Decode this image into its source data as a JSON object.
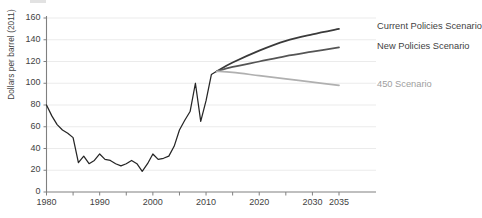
{
  "axes": {
    "ylabel": "Dollars per barrel (2011)",
    "y_ticks": [
      "0",
      "20",
      "40",
      "60",
      "80",
      "100",
      "120",
      "140",
      "160"
    ],
    "x_ticks": [
      "1980",
      "1990",
      "2000",
      "2010",
      "2020",
      "2030",
      "2035"
    ]
  },
  "colors": {
    "historical": "#262626",
    "current_policies": "#3a3a3a",
    "new_policies": "#555555",
    "scenario_450": "#b0b0b0",
    "gridline": "#ebebeb",
    "axis": "#808080",
    "text": "#3f3f3f",
    "muted_text": "#9e9e9e"
  },
  "labels": {
    "current_policies": "Current Policies Scenario",
    "new_policies": "New Policies Scenario",
    "scenario_450": "450 Scenario"
  },
  "chart_data": {
    "type": "line",
    "title": "",
    "xlabel": "",
    "ylabel": "Dollars per barrel (2011)",
    "xlim": [
      1980,
      2035
    ],
    "ylim": [
      0,
      160
    ],
    "ytick_step": 20,
    "xtick_values": [
      1980,
      1990,
      2000,
      2010,
      2020,
      2030,
      2035
    ],
    "xminor_step": 5,
    "grid": "horizontal",
    "legend_position": "right-inline-labels",
    "series": [
      {
        "name": "Historical",
        "color": "#262626",
        "x": [
          1980,
          1981,
          1982,
          1983,
          1984,
          1985,
          1986,
          1987,
          1988,
          1989,
          1990,
          1991,
          1992,
          1993,
          1994,
          1995,
          1996,
          1997,
          1998,
          1999,
          2000,
          2001,
          2002,
          2003,
          2004,
          2005,
          2006,
          2007,
          2008,
          2009,
          2010,
          2011,
          2012
        ],
        "values": [
          80,
          70,
          62,
          57,
          54,
          50,
          27,
          33,
          26,
          29,
          35,
          30,
          29,
          26,
          24,
          26,
          29,
          26,
          19,
          26,
          35,
          30,
          31,
          33,
          42,
          57,
          66,
          74,
          100,
          65,
          84,
          108,
          111
        ]
      },
      {
        "name": "Current Policies Scenario",
        "color": "#3a3a3a",
        "x": [
          2012,
          2015,
          2020,
          2025,
          2030,
          2035
        ],
        "values": [
          111,
          119,
          130,
          139,
          145,
          150
        ]
      },
      {
        "name": "New Policies Scenario",
        "color": "#555555",
        "x": [
          2012,
          2015,
          2020,
          2025,
          2030,
          2035
        ],
        "values": [
          111,
          115,
          120,
          125,
          129,
          133
        ]
      },
      {
        "name": "450 Scenario",
        "color": "#b0b0b0",
        "x": [
          2012,
          2015,
          2020,
          2025,
          2030,
          2035
        ],
        "values": [
          111,
          110,
          107,
          104,
          101,
          98
        ]
      }
    ]
  }
}
